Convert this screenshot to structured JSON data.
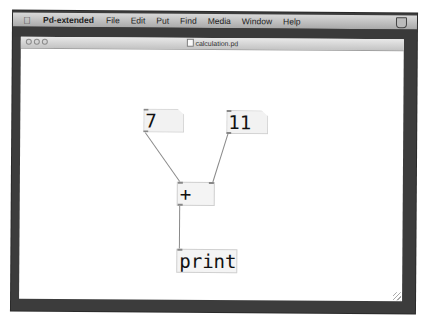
{
  "menubar": {
    "apple_icon": "apple-logo-icon",
    "app_name": "Pd-extended",
    "items": [
      "File",
      "Edit",
      "Put",
      "Find",
      "Media",
      "Window",
      "Help"
    ],
    "status_icon": "shield-status-icon"
  },
  "window": {
    "title": "calculation.pd",
    "title_icon": "document-icon",
    "buttons": [
      "close",
      "minimize",
      "zoom"
    ]
  },
  "patch": {
    "number_boxes": [
      {
        "id": "num-left",
        "value": "7"
      },
      {
        "id": "num-right",
        "value": "11"
      }
    ],
    "objects": [
      {
        "id": "add-object",
        "text": "+"
      },
      {
        "id": "print-object",
        "text": "print"
      }
    ],
    "connections": [
      {
        "from": "num-left",
        "to": "add-object",
        "inlet": 0
      },
      {
        "from": "num-right",
        "to": "add-object",
        "inlet": 1
      },
      {
        "from": "add-object",
        "to": "print-object",
        "inlet": 0
      }
    ]
  }
}
